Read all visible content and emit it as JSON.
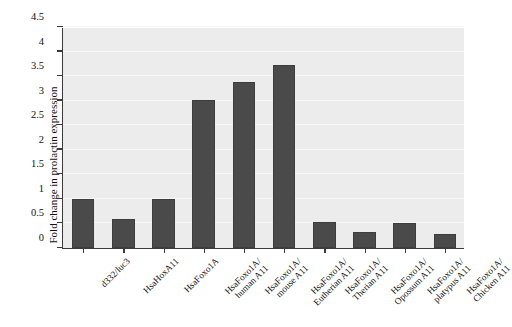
{
  "chart_data": {
    "type": "bar",
    "title": "",
    "subtitle": "",
    "xlabel": "",
    "ylabel": "Fold change in prolactin expression",
    "ylim": [
      0,
      4.5
    ],
    "yticks": [
      "0",
      "0.5",
      "1",
      "1.5",
      "2",
      "2.5",
      "3",
      "3.5",
      "4",
      "4.5"
    ],
    "ytick_values": [
      0,
      0.5,
      1,
      1.5,
      2,
      2.5,
      3,
      3.5,
      4,
      4.5
    ],
    "grid": "horizontal",
    "legend": "none",
    "categories": [
      "d332/luc3",
      "HsaHoxA11",
      "HsaFoxo1A",
      "HsaFoxo1A/\nhuman A11",
      "HsaFoxo1A/\nmouse A11",
      "HsaFoxo1A/\nEutherian A11",
      "HsaFoxo1A/\nTherian A11",
      "HsaFoxo1A/\nOpossum A11",
      "HsaFoxo1A/\nplatypus A11",
      "HsaFoxo1A/\nChicken A11"
    ],
    "category_lines": [
      [
        "d332/luc3"
      ],
      [
        "HsaHoxA11"
      ],
      [
        "HsaFoxo1A"
      ],
      [
        "HsaFoxo1A/",
        "human A11"
      ],
      [
        "HsaFoxo1A/",
        "mouse A11"
      ],
      [
        "HsaFoxo1A/",
        "Eutherian A11"
      ],
      [
        "HsaFoxo1A/",
        "Therian A11"
      ],
      [
        "HsaFoxo1A/",
        "Opossum A11"
      ],
      [
        "HsaFoxo1A/",
        "platypus A11"
      ],
      [
        "HsaFoxo1A/",
        "Chicken A11"
      ]
    ],
    "values": [
      1.0,
      0.59,
      0.99,
      3.02,
      3.38,
      3.72,
      0.53,
      0.32,
      0.51,
      0.28
    ],
    "bar_color": "#4a4a4a",
    "plot_background": "#ececec",
    "axis_color": "#3a3a3a",
    "gridline_color": "#f7f7f7"
  }
}
